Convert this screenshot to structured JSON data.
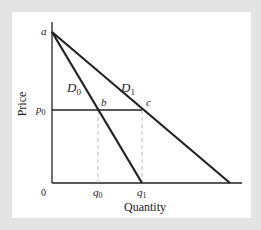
{
  "diagram": {
    "type": "demand-curves",
    "axes": {
      "xlabel": "Quantity",
      "ylabel": "Price",
      "origin_label": "0"
    },
    "points": {
      "a": "a",
      "b": "b",
      "c": "c"
    },
    "curves": [
      {
        "name": "D",
        "sub": "0"
      },
      {
        "name": "D",
        "sub": "1"
      }
    ],
    "price_level": {
      "name": "p",
      "sub": "0"
    },
    "quantities": [
      {
        "name": "q",
        "sub": "0"
      },
      {
        "name": "q",
        "sub": "1"
      }
    ],
    "colors": {
      "background": "#e4e4e4",
      "panel": "#ffffff",
      "line": "#222222",
      "dashed": "#aaaaaa"
    }
  }
}
